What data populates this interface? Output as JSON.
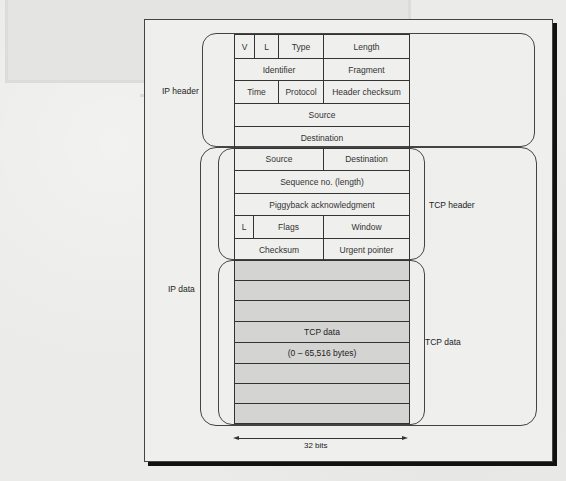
{
  "figure": {
    "outer_labels": {
      "ip_header": "IP header",
      "ip_data": "IP data",
      "tcp_header": "TCP header",
      "tcp_data": "TCP data"
    },
    "ip_header_rows": [
      {
        "cells": [
          "V",
          "L",
          "Type",
          "Length"
        ]
      },
      {
        "cells": [
          "Identifier",
          "Fragment"
        ]
      },
      {
        "cells": [
          "Time",
          "Protocol",
          "Header checksum"
        ]
      },
      {
        "cells": [
          "Source"
        ]
      },
      {
        "cells": [
          "Destination"
        ]
      }
    ],
    "tcp_header_rows": [
      {
        "cells": [
          "Source",
          "Destination"
        ]
      },
      {
        "cells": [
          "Sequence no. (length)"
        ]
      },
      {
        "cells": [
          "Piggyback acknowledgment"
        ]
      },
      {
        "cells": [
          "L",
          "Flags",
          "Window"
        ]
      },
      {
        "cells": [
          "Checksum",
          "Urgent pointer"
        ]
      }
    ],
    "tcp_data": {
      "title": "TCP data",
      "range": "(0 – 65,516 bytes)",
      "row_count": 8
    },
    "width_label": "32 bits",
    "colors": {
      "line": "#333333",
      "data_shading": "#d4d4d2",
      "frame_shadow": "#111111",
      "paper": "#efefed"
    }
  }
}
